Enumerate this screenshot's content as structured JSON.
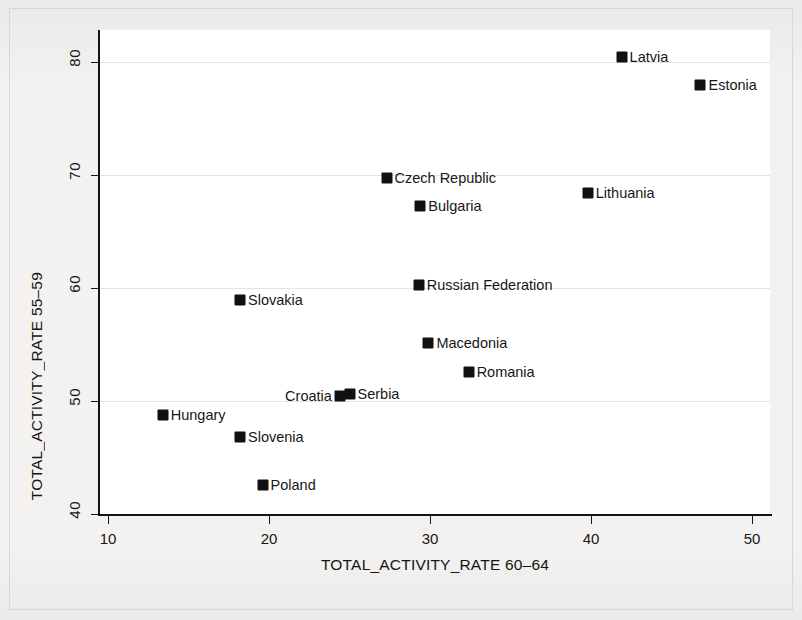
{
  "chart_data": {
    "type": "scatter",
    "title": "",
    "xlabel": "TOTAL_ACTIVITY_RATE 60–64",
    "ylabel": "TOTAL_ACTIVITY_RATE 55–59",
    "xlim": [
      10,
      50
    ],
    "ylim": [
      40,
      80
    ],
    "xticks": [
      10,
      20,
      30,
      40,
      50
    ],
    "yticks": [
      40,
      50,
      60,
      70,
      80
    ],
    "xtick_labels": [
      "10",
      "20",
      "30",
      "40",
      "50"
    ],
    "ytick_labels": [
      "40",
      "50",
      "60",
      "70",
      "80"
    ],
    "grid": true,
    "grid_axis": "y",
    "legend": "none",
    "marker": "filled-square",
    "marker_color": "#111111",
    "points": [
      {
        "label": "Latvia",
        "x": 41.9,
        "y": 80.4,
        "label_side": "right"
      },
      {
        "label": "Estonia",
        "x": 46.8,
        "y": 78.0,
        "label_side": "right"
      },
      {
        "label": "Czech Republic",
        "x": 27.3,
        "y": 69.7,
        "label_side": "right"
      },
      {
        "label": "Lithuania",
        "x": 39.8,
        "y": 68.4,
        "label_side": "right"
      },
      {
        "label": "Bulgaria",
        "x": 29.4,
        "y": 67.3,
        "label_side": "right"
      },
      {
        "label": "Russian Federation",
        "x": 29.3,
        "y": 60.3,
        "label_side": "right"
      },
      {
        "label": "Slovakia",
        "x": 18.2,
        "y": 58.9,
        "label_side": "right"
      },
      {
        "label": "Macedonia",
        "x": 29.9,
        "y": 55.1,
        "label_side": "right"
      },
      {
        "label": "Romania",
        "x": 32.4,
        "y": 52.6,
        "label_side": "right"
      },
      {
        "label": "Serbia",
        "x": 25.0,
        "y": 50.6,
        "label_side": "right"
      },
      {
        "label": "Croatia",
        "x": 24.4,
        "y": 50.4,
        "label_side": "left"
      },
      {
        "label": "Hungary",
        "x": 13.4,
        "y": 48.8,
        "label_side": "right"
      },
      {
        "label": "Slovenia",
        "x": 18.2,
        "y": 46.8,
        "label_side": "right"
      },
      {
        "label": "Poland",
        "x": 19.6,
        "y": 42.6,
        "label_side": "right"
      }
    ]
  }
}
